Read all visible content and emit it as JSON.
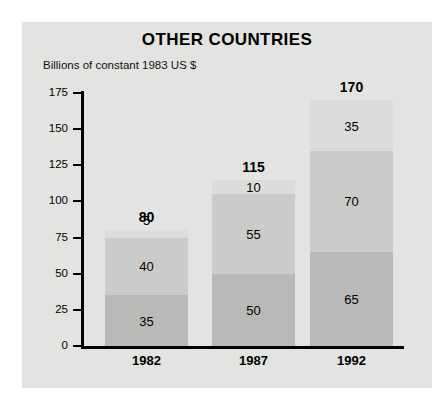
{
  "chart_data": {
    "type": "bar",
    "subtype": "stacked-bar",
    "title": "OTHER COUNTRIES",
    "subtitle": "Billions of constant 1983 US $",
    "xlabel": "",
    "ylabel": "Billions of constant 1983 US $",
    "categories": [
      "1982",
      "1987",
      "1992"
    ],
    "series": [
      {
        "name": "bottom-segment",
        "values": [
          35,
          50,
          65
        ]
      },
      {
        "name": "middle-segment",
        "values": [
          40,
          55,
          70
        ]
      },
      {
        "name": "top-segment",
        "values": [
          5,
          10,
          35
        ]
      }
    ],
    "totals": [
      80,
      115,
      170
    ],
    "ylim": [
      0,
      175
    ],
    "yticks": [
      0,
      25,
      50,
      75,
      100,
      125,
      150,
      175
    ],
    "ytick_labels": [
      "0",
      "25",
      "50",
      "75",
      "100",
      "125",
      "150",
      "175"
    ],
    "grid": false,
    "legend": "none",
    "colors": {
      "panel_background": "#e3e3e1",
      "page_background": "#ffffff",
      "axis": "#000000",
      "segment_bottom": "#b9b9b7",
      "segment_middle": "#cbcbc9",
      "segment_top": "#dcdcda",
      "text": "#000000"
    },
    "bars": [
      {
        "category": "1982",
        "total_label": "80",
        "segments": [
          {
            "label": "5",
            "value": 5,
            "position": "top",
            "label_placement": "above"
          },
          {
            "label": "40",
            "value": 40,
            "position": "middle",
            "label_placement": "inside"
          },
          {
            "label": "35",
            "value": 35,
            "position": "bottom",
            "label_placement": "inside"
          }
        ]
      },
      {
        "category": "1987",
        "total_label": "115",
        "segments": [
          {
            "label": "10",
            "value": 10,
            "position": "top",
            "label_placement": "inside"
          },
          {
            "label": "55",
            "value": 55,
            "position": "middle",
            "label_placement": "inside"
          },
          {
            "label": "50",
            "value": 50,
            "position": "bottom",
            "label_placement": "inside"
          }
        ]
      },
      {
        "category": "1992",
        "total_label": "170",
        "segments": [
          {
            "label": "35",
            "value": 35,
            "position": "top",
            "label_placement": "inside"
          },
          {
            "label": "70",
            "value": 70,
            "position": "middle",
            "label_placement": "inside"
          },
          {
            "label": "65",
            "value": 65,
            "position": "bottom",
            "label_placement": "inside"
          }
        ]
      }
    ]
  }
}
